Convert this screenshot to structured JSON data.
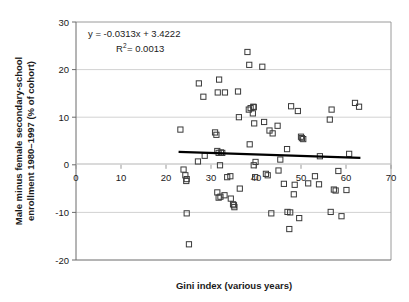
{
  "chart_data": {
    "type": "scatter",
    "title": "",
    "xlabel": "Gini index (various years)",
    "ylabel": "Male minus female secondary-school enrollment 1980–1997 (% of cohort)",
    "xlim": [
      0,
      70
    ],
    "ylim": [
      -20,
      30
    ],
    "xticks": [
      0,
      10,
      20,
      30,
      40,
      50,
      60,
      70
    ],
    "yticks": [
      -20,
      -10,
      0,
      10,
      20,
      30
    ],
    "xtick_labels": [
      "0",
      "10",
      "20",
      "30",
      "40",
      "50",
      "60",
      "70"
    ],
    "ytick_labels": [
      "-20",
      "-10",
      "0",
      "10",
      "20",
      "30"
    ],
    "grid": "horizontal",
    "legend": "none",
    "marker": "open-square",
    "marker_color": "#3a3a3a",
    "annotations": [
      {
        "name": "regression-equation",
        "text": "y = -0.0313x + 3.4222"
      },
      {
        "name": "r-squared",
        "text_prefix": "R",
        "text_sup": "2",
        "text_suffix": " = 0.0013"
      }
    ],
    "trendline": {
      "type": "linear",
      "slope": -0.0313,
      "intercept": 3.4222,
      "x_start": 22.8,
      "x_end": 63.2,
      "color": "#000000",
      "width": 2.2
    },
    "points": [
      [
        23.2,
        7.4
      ],
      [
        23.9,
        -1.0
      ],
      [
        24.3,
        -2.2
      ],
      [
        24.6,
        -3.0
      ],
      [
        24.5,
        -3.4
      ],
      [
        24.6,
        -10.2
      ],
      [
        25.1,
        -16.7
      ],
      [
        27.3,
        17.1
      ],
      [
        27.1,
        0.7
      ],
      [
        28.3,
        14.3
      ],
      [
        28.6,
        1.9
      ],
      [
        30.9,
        6.8
      ],
      [
        31.2,
        6.3
      ],
      [
        31.5,
        15.2
      ],
      [
        31.8,
        17.9
      ],
      [
        31.4,
        2.9
      ],
      [
        31.7,
        2.5
      ],
      [
        32.2,
        2.6
      ],
      [
        32.5,
        2.5
      ],
      [
        32.0,
        -0.1
      ],
      [
        31.4,
        -5.8
      ],
      [
        32.1,
        -6.7
      ],
      [
        31.7,
        -6.9
      ],
      [
        33.0,
        -6.4
      ],
      [
        33.1,
        15.2
      ],
      [
        33.6,
        -2.6
      ],
      [
        34.3,
        -2.4
      ],
      [
        34.4,
        -7.1
      ],
      [
        34.9,
        -8.3
      ],
      [
        35.2,
        -8.9
      ],
      [
        35.1,
        -8.5
      ],
      [
        36.0,
        15.4
      ],
      [
        36.2,
        10.0
      ],
      [
        36.4,
        -5.0
      ],
      [
        38.1,
        23.7
      ],
      [
        38.5,
        21.0
      ],
      [
        38.4,
        11.6
      ],
      [
        38.8,
        11.9
      ],
      [
        39.4,
        12.2
      ],
      [
        39.5,
        12.1
      ],
      [
        39.3,
        10.8
      ],
      [
        39.6,
        8.7
      ],
      [
        39.9,
        0.6
      ],
      [
        39.5,
        -0.1
      ],
      [
        39.8,
        -2.6
      ],
      [
        38.6,
        4.3
      ],
      [
        41.4,
        20.6
      ],
      [
        41.8,
        9.0
      ],
      [
        42.2,
        -1.9
      ],
      [
        42.6,
        -2.2
      ],
      [
        43.0,
        7.2
      ],
      [
        43.7,
        6.6
      ],
      [
        43.4,
        -10.2
      ],
      [
        44.8,
        8.2
      ],
      [
        45.0,
        -1.2
      ],
      [
        45.4,
        1.1
      ],
      [
        46.2,
        -4.0
      ],
      [
        46.9,
        3.3
      ],
      [
        47.0,
        -9.9
      ],
      [
        47.4,
        -13.5
      ],
      [
        47.6,
        -10.0
      ],
      [
        47.8,
        12.3
      ],
      [
        48.4,
        -6.2
      ],
      [
        48.6,
        -4.2
      ],
      [
        49.3,
        11.3
      ],
      [
        49.6,
        -11.2
      ],
      [
        50.0,
        5.9
      ],
      [
        50.2,
        5.6
      ],
      [
        50.5,
        5.4
      ],
      [
        51.6,
        -3.9
      ],
      [
        53.1,
        -2.4
      ],
      [
        54.2,
        1.8
      ],
      [
        54.0,
        -4.1
      ],
      [
        56.4,
        9.5
      ],
      [
        56.8,
        11.6
      ],
      [
        56.6,
        -9.9
      ],
      [
        57.3,
        -5.2
      ],
      [
        57.7,
        -5.4
      ],
      [
        58.3,
        -1.3
      ],
      [
        59.0,
        -10.8
      ],
      [
        60.1,
        -5.3
      ],
      [
        60.7,
        2.3
      ],
      [
        62.0,
        13.0
      ],
      [
        62.9,
        12.2
      ]
    ]
  }
}
